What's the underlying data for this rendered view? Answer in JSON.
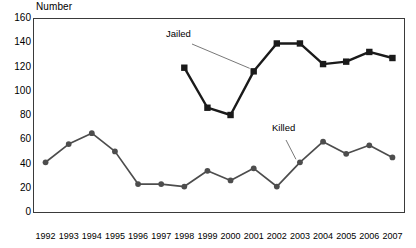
{
  "chart_data": {
    "type": "line",
    "title": "",
    "ylabel": "Number",
    "xlabel": "",
    "ylim": [
      0,
      160
    ],
    "ytick_values": [
      0,
      20,
      40,
      60,
      80,
      100,
      120,
      140,
      160
    ],
    "ytick_labels": [
      "0",
      "20",
      "40",
      "60",
      "80",
      "100",
      "120",
      "140",
      "160"
    ],
    "grid": false,
    "legend_position": "inline-annotations",
    "categories": [
      "1992",
      "1993",
      "1994",
      "1995",
      "1996",
      "1997",
      "1998",
      "1999",
      "2000",
      "2001",
      "2002",
      "2003",
      "2004",
      "2005",
      "2006",
      "2007"
    ],
    "x": [
      1992,
      1993,
      1994,
      1995,
      1996,
      1997,
      1998,
      1999,
      2000,
      2001,
      2002,
      2003,
      2004,
      2005,
      2006,
      2007
    ],
    "series": [
      {
        "name": "Jailed",
        "marker": "square",
        "color": "#1a1a1a",
        "x": [
          1998,
          1999,
          2000,
          2001,
          2002,
          2003,
          2004,
          2005,
          2006,
          2007
        ],
        "values": [
          119,
          86,
          80,
          116,
          139,
          139,
          122,
          124,
          132,
          127
        ]
      },
      {
        "name": "Killed",
        "marker": "circle",
        "color": "#4d4d4d",
        "x": [
          1992,
          1993,
          1994,
          1995,
          1996,
          1997,
          1998,
          1999,
          2000,
          2001,
          2002,
          2003,
          2004,
          2005,
          2006,
          2007
        ],
        "values": [
          41,
          56,
          65,
          50,
          23,
          23,
          21,
          34,
          26,
          36,
          21,
          41,
          58,
          48,
          55,
          45
        ]
      }
    ],
    "annotations": [
      {
        "text": "Jailed",
        "points_to_year": 2001,
        "points_to_value": 116
      },
      {
        "text": "Killed",
        "points_to_year": 2003,
        "points_to_value": 41
      }
    ]
  },
  "axis": {
    "y_title": "Number"
  }
}
